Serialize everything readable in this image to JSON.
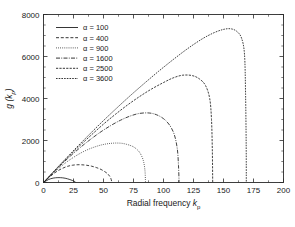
{
  "chart_data": {
    "type": "line",
    "title": "",
    "xlabel": "Radial frequency k_p",
    "xlabel_main": "Radial frequency",
    "xlabel_sym": "k",
    "xlabel_sub": "p",
    "ylabel": "g (k_p)",
    "ylabel_main": "g",
    "ylabel_open": " (",
    "ylabel_sym": "k",
    "ylabel_sub": "p",
    "ylabel_close": ")",
    "xlim": [
      0,
      200
    ],
    "ylim": [
      0,
      8000
    ],
    "xticks": [
      0,
      25,
      50,
      75,
      100,
      125,
      150,
      175,
      200
    ],
    "yticks": [
      0,
      2000,
      4000,
      6000,
      8000
    ],
    "xtick_labels": [
      "0",
      "25",
      "50",
      "75",
      "100",
      "125",
      "150",
      "175",
      "200"
    ],
    "ytick_labels": [
      "0",
      "2000",
      "4000",
      "6000",
      "8000"
    ],
    "xminor_step": 12.5,
    "yminor_step": 500,
    "grid": false,
    "legend_position": "upper-left",
    "legend_symbol": "α",
    "series": [
      {
        "name": "α = 100",
        "alpha": 100,
        "dash": "none",
        "peak_x": 20,
        "peak_y": 230,
        "zero_x": 27,
        "points": [
          [
            0,
            0
          ],
          [
            2,
            70
          ],
          [
            4,
            135
          ],
          [
            6,
            180
          ],
          [
            8,
            208
          ],
          [
            10,
            225
          ],
          [
            12,
            232
          ],
          [
            14,
            231
          ],
          [
            16,
            222
          ],
          [
            18,
            204
          ],
          [
            20,
            176
          ],
          [
            22,
            140
          ],
          [
            24,
            98
          ],
          [
            25.5,
            62
          ],
          [
            26.5,
            30
          ],
          [
            27,
            0
          ]
        ]
      },
      {
        "name": "α = 400",
        "alpha": 400,
        "dash": "dashed",
        "peak_x": 40,
        "peak_y": 840,
        "zero_x": 57,
        "points": [
          [
            0,
            0
          ],
          [
            4,
            210
          ],
          [
            8,
            400
          ],
          [
            12,
            560
          ],
          [
            16,
            680
          ],
          [
            20,
            770
          ],
          [
            24,
            822
          ],
          [
            28,
            845
          ],
          [
            32,
            843
          ],
          [
            36,
            820
          ],
          [
            40,
            778
          ],
          [
            44,
            712
          ],
          [
            48,
            620
          ],
          [
            52,
            480
          ],
          [
            54,
            382
          ],
          [
            56,
            215
          ],
          [
            57,
            0
          ]
        ]
      },
      {
        "name": "α = 900",
        "alpha": 900,
        "dash": "dotted",
        "peak_x": 60,
        "peak_y": 1880,
        "zero_x": 85,
        "points": [
          [
            0,
            0
          ],
          [
            6,
            330
          ],
          [
            12,
            640
          ],
          [
            18,
            920
          ],
          [
            24,
            1160
          ],
          [
            30,
            1370
          ],
          [
            36,
            1545
          ],
          [
            42,
            1680
          ],
          [
            48,
            1785
          ],
          [
            54,
            1850
          ],
          [
            60,
            1878
          ],
          [
            66,
            1860
          ],
          [
            72,
            1770
          ],
          [
            76,
            1660
          ],
          [
            80,
            1440
          ],
          [
            83,
            1080
          ],
          [
            84.5,
            600
          ],
          [
            85,
            0
          ]
        ]
      },
      {
        "name": "α = 1600",
        "alpha": 1600,
        "dash": "dashdot",
        "peak_x": 80,
        "peak_y": 3300,
        "zero_x": 113,
        "points": [
          [
            0,
            0
          ],
          [
            8,
            470
          ],
          [
            16,
            920
          ],
          [
            24,
            1340
          ],
          [
            32,
            1730
          ],
          [
            40,
            2090
          ],
          [
            48,
            2420
          ],
          [
            56,
            2710
          ],
          [
            64,
            2960
          ],
          [
            72,
            3160
          ],
          [
            80,
            3290
          ],
          [
            88,
            3310
          ],
          [
            94,
            3230
          ],
          [
            100,
            3040
          ],
          [
            105,
            2740
          ],
          [
            109,
            2280
          ],
          [
            111.5,
            1600
          ],
          [
            112.5,
            800
          ],
          [
            113,
            0
          ]
        ]
      },
      {
        "name": "α = 2500",
        "alpha": 2500,
        "dash": "longdash",
        "peak_x": 98,
        "peak_y": 5120,
        "zero_x": 141,
        "points": [
          [
            0,
            0
          ],
          [
            10,
            600
          ],
          [
            20,
            1180
          ],
          [
            30,
            1740
          ],
          [
            40,
            2270
          ],
          [
            50,
            2780
          ],
          [
            60,
            3250
          ],
          [
            70,
            3690
          ],
          [
            80,
            4090
          ],
          [
            90,
            4450
          ],
          [
            100,
            4760
          ],
          [
            108,
            4980
          ],
          [
            116,
            5110
          ],
          [
            124,
            5090
          ],
          [
            130,
            4930
          ],
          [
            135,
            4620
          ],
          [
            138.5,
            4000
          ],
          [
            140,
            3000
          ],
          [
            140.7,
            1500
          ],
          [
            141,
            0
          ]
        ]
      },
      {
        "name": "α = 3600",
        "alpha": 3600,
        "dash": "longdash2",
        "peak_x": 120,
        "peak_y": 7320,
        "zero_x": 169,
        "points": [
          [
            0,
            0
          ],
          [
            12,
            740
          ],
          [
            24,
            1460
          ],
          [
            36,
            2160
          ],
          [
            48,
            2840
          ],
          [
            60,
            3490
          ],
          [
            72,
            4120
          ],
          [
            84,
            4720
          ],
          [
            96,
            5300
          ],
          [
            108,
            5850
          ],
          [
            120,
            6370
          ],
          [
            132,
            6830
          ],
          [
            142,
            7130
          ],
          [
            150,
            7290
          ],
          [
            156,
            7320
          ],
          [
            161,
            7200
          ],
          [
            165,
            6880
          ],
          [
            167.5,
            6100
          ],
          [
            168.4,
            4200
          ],
          [
            168.9,
            1800
          ],
          [
            169,
            0
          ]
        ]
      }
    ]
  },
  "legend": {
    "entries": [
      {
        "label": "α = 100"
      },
      {
        "label": "α = 400"
      },
      {
        "label": "α = 900"
      },
      {
        "label": "α = 1600"
      },
      {
        "label": "α = 2500"
      },
      {
        "label": "α = 3600"
      }
    ]
  }
}
